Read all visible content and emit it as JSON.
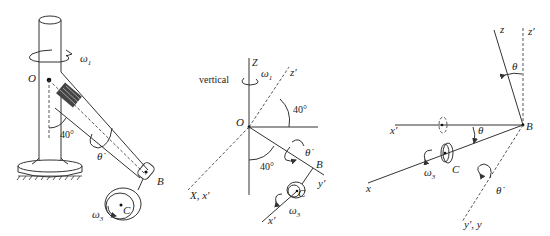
{
  "figure": {
    "panels": [
      {
        "id": "mechanism",
        "labels": {
          "omega1": "ω",
          "omega1_sub": "1",
          "origin": "O",
          "angle": "40°",
          "theta_dot": "θ̇",
          "point_b": "B",
          "point_c": "C",
          "omega3": "ω",
          "omega3_sub": "3"
        }
      },
      {
        "id": "axes-diagram",
        "labels": {
          "z_axis": "Z",
          "vertical": "vertical",
          "omega1": "ω",
          "omega1_sub": "1",
          "z_prime": "z′",
          "angle_top": "40°",
          "origin": "O",
          "angle_bottom": "40°",
          "theta_dot": "θ̇",
          "point_b": "B",
          "y_prime": "y′",
          "point_c": "C",
          "x_axis": "X, x′",
          "omega3": "ω",
          "omega3_sub": "3",
          "x_prime": "x′"
        }
      },
      {
        "id": "frame-B-diagram",
        "labels": {
          "z": "z",
          "z_prime": "z′",
          "theta_top": "θ",
          "x_prime": "x′",
          "theta_mid": "θ",
          "point_b": "B",
          "omega3": "ω",
          "omega3_sub": "3",
          "point_c": "C",
          "x": "x",
          "theta_dot": "θ̇",
          "y_axes": "y′, y"
        }
      }
    ]
  }
}
